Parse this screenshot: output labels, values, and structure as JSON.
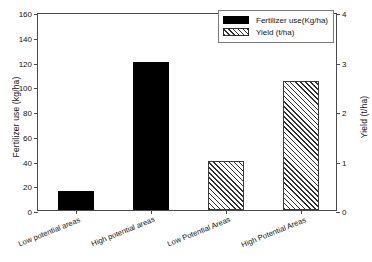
{
  "chart_data": {
    "type": "bar",
    "title": "",
    "subtitle": "",
    "categories": [
      "Low potential areas",
      "High potential areas",
      "Low Potential Areas",
      "High Potential Areas"
    ],
    "series": [
      {
        "name": "Fertilizer use(Kg/ha)",
        "axis": "left",
        "unit": "kg/ha",
        "style": "solid-black",
        "values": [
          15.5,
          120,
          null,
          null
        ]
      },
      {
        "name": "Yield (t/ha)",
        "axis": "right",
        "unit": "t/ha",
        "style": "diagonal-hatch",
        "values": [
          null,
          null,
          1.0,
          2.6
        ]
      }
    ],
    "bars": [
      {
        "category": "Low potential areas",
        "series": "Fertilizer use(Kg/ha)",
        "value": 15.5,
        "unit": "kg/ha"
      },
      {
        "category": "High potential areas",
        "series": "Fertilizer use(Kg/ha)",
        "value": 120,
        "unit": "kg/ha"
      },
      {
        "category": "Low Potential Areas",
        "series": "Yield (t/ha)",
        "value": 1.0,
        "unit": "t/ha"
      },
      {
        "category": "High Potential Areas",
        "series": "Yield (t/ha)",
        "value": 2.6,
        "unit": "t/ha"
      }
    ],
    "xlabel": "",
    "ylabel": "Fertilizer use (kg/ha)",
    "ylabel_right": "Yield (t/ha)",
    "ylim": [
      0,
      160
    ],
    "ylim_right": [
      0,
      4
    ],
    "yticks": [
      0,
      20,
      40,
      60,
      80,
      100,
      120,
      140,
      160
    ],
    "yticks_right": [
      0,
      1,
      2,
      3,
      4
    ],
    "ytick_labels": [
      "0",
      "20",
      "40",
      "60",
      "80",
      "100",
      "120",
      "140",
      "160"
    ],
    "ytick_labels_right": [
      "0",
      "1",
      "2",
      "3",
      "4"
    ],
    "grid": false,
    "legend_position": "top-right",
    "legend_entries": [
      "Fertilizer use(Kg/ha)",
      "Yield (t/ha)"
    ],
    "colors": {
      "fertilizer_bar": "#000000",
      "yield_bar_hatch": "#2e2e2e",
      "yield_bar_fill": "#ffffff",
      "axis": "#4a4a4a",
      "text": "#141414",
      "background": "#ffffff"
    }
  },
  "legend": {
    "items": [
      {
        "label": "Fertilizer use(Kg/ha)",
        "swatch": "solid"
      },
      {
        "label": "Yield (t/ha)",
        "swatch": "hatch"
      }
    ]
  },
  "axes": {
    "left_title": "Fertilizer use (kg/ha)",
    "right_title": "Yield (t/ha)",
    "left_ticks": [
      "160",
      "140",
      "120",
      "100",
      "80",
      "60",
      "40",
      "20",
      "0"
    ],
    "right_ticks": [
      "4",
      "3",
      "2",
      "1",
      "0"
    ]
  }
}
